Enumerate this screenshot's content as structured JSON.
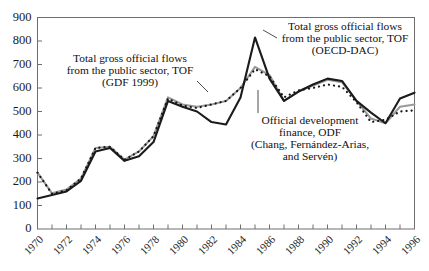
{
  "chart_data": {
    "type": "line",
    "title": "",
    "subtitle": "",
    "xlabel": "",
    "ylabel": "",
    "xlim": [
      1970,
      1996
    ],
    "ylim": [
      0,
      900
    ],
    "grid": false,
    "legend_position": "inline-annotations",
    "x": [
      1970,
      1971,
      1972,
      1973,
      1974,
      1975,
      1976,
      1977,
      1978,
      1979,
      1980,
      1981,
      1982,
      1983,
      1984,
      1985,
      1986,
      1987,
      1988,
      1989,
      1990,
      1991,
      1992,
      1993,
      1994,
      1995,
      1996
    ],
    "ytick_labels": [
      "0",
      "100",
      "200",
      "300",
      "400",
      "500",
      "600",
      "700",
      "800",
      "900"
    ],
    "ytick_values": [
      0,
      100,
      200,
      300,
      400,
      500,
      600,
      700,
      800,
      900
    ],
    "xtick_labels": [
      "1970",
      "1972",
      "1974",
      "1976",
      "1978",
      "1980",
      "1982",
      "1984",
      "1986",
      "1988",
      "1990",
      "1992",
      "1994",
      "1996"
    ],
    "xtick_values": [
      1970,
      1972,
      1974,
      1976,
      1978,
      1980,
      1982,
      1984,
      1986,
      1988,
      1990,
      1992,
      1994,
      1996
    ],
    "series": [
      {
        "name": "Total gross official flows from the public sector, TOF (OECD-DAC)",
        "short_name": "TOF (OECD-DAC)",
        "style": "solid",
        "color": "#1b1b1b",
        "values": [
          130,
          145,
          160,
          205,
          330,
          345,
          290,
          310,
          370,
          545,
          520,
          500,
          455,
          445,
          560,
          815,
          640,
          545,
          585,
          615,
          640,
          630,
          545,
          495,
          450,
          555,
          580
        ]
      },
      {
        "name": "Total gross official flows from the public sector, TOF (GDF 1999)",
        "short_name": "TOF (GDF 1999)",
        "style": "solid",
        "color": "#9a9a9a",
        "values": [
          240,
          152,
          168,
          215,
          345,
          350,
          295,
          330,
          395,
          560,
          530,
          520,
          530,
          545,
          600,
          690,
          655,
          545,
          585,
          610,
          635,
          625,
          545,
          470,
          450,
          520,
          530
        ]
      },
      {
        "name": "Official development finance, ODF (Chang, Fernández-Arias, and Servén)",
        "short_name": "ODF",
        "style": "dotted",
        "color": "#161616",
        "values": [
          240,
          150,
          165,
          215,
          345,
          350,
          295,
          330,
          395,
          555,
          525,
          515,
          530,
          545,
          600,
          680,
          650,
          560,
          590,
          600,
          615,
          605,
          540,
          455,
          465,
          500,
          505
        ]
      }
    ],
    "annotations": [
      {
        "id": "annot-tof-gdf",
        "lines": [
          "Total gross official flows",
          "from the public sector, TOF",
          "(GDF 1999)"
        ],
        "anchor_x": 130,
        "anchor_y": 62
      },
      {
        "id": "annot-tof-oecd",
        "lines": [
          "Total gross official flows",
          "from the public sector, TOF",
          "(OECD-DAC)"
        ],
        "anchor_x": 340,
        "anchor_y": 30
      },
      {
        "id": "annot-odf",
        "lines": [
          "Official development",
          "finance, ODF",
          "(Chang, Fernández-Arias,",
          "and Servén)"
        ],
        "anchor_x": 310,
        "anchor_y": 132
      }
    ]
  },
  "axes": {
    "y": {
      "labels": [
        "900",
        "800",
        "700",
        "600",
        "500",
        "400",
        "300",
        "200",
        "100",
        "0"
      ]
    },
    "x": {
      "labels": [
        "1970",
        "1972",
        "1974",
        "1976",
        "1978",
        "1980",
        "1982",
        "1984",
        "1986",
        "1988",
        "1990",
        "1992",
        "1994",
        "1996"
      ]
    }
  },
  "annotations": {
    "gdf": {
      "line1": "Total gross official flows",
      "line2": "from the public sector, TOF",
      "line3": "(GDF 1999)"
    },
    "oecd": {
      "line1": "Total gross official flows",
      "line2": "from the public sector, TOF",
      "line3": "(OECD-DAC)"
    },
    "odf": {
      "line1": "Official development",
      "line2": "finance, ODF",
      "line3": "(Chang, Fernández-Arias,",
      "line4": "and Servén)"
    }
  }
}
